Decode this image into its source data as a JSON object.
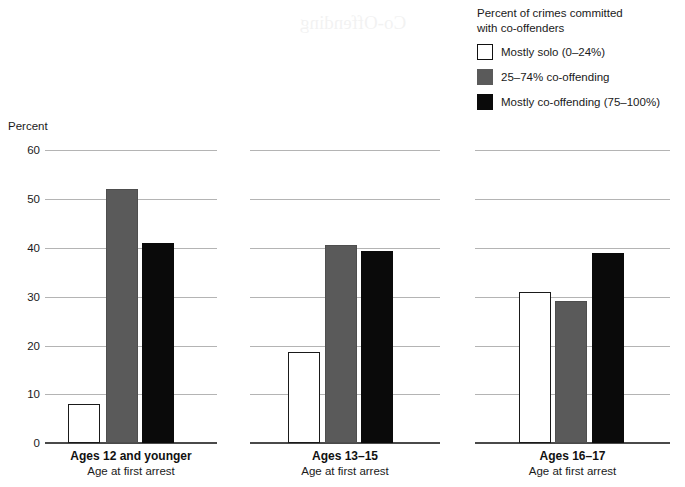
{
  "legend": {
    "title": "Percent of crimes committed\nwith co-offenders",
    "items": [
      {
        "label": "Mostly solo (0–24%)",
        "swatch": "white",
        "color": "#ffffff"
      },
      {
        "label": "25–74% co-offending",
        "swatch": "gray",
        "color": "#5a5a5a"
      },
      {
        "label": "Mostly co-offending (75–100%)",
        "swatch": "black",
        "color": "#0a0a0a"
      }
    ]
  },
  "axis": {
    "label": "Percent",
    "ticks": [
      "60",
      "50",
      "40",
      "30",
      "20",
      "10",
      "0"
    ]
  },
  "panels": [
    {
      "title": "Ages 12 and younger",
      "subtitle": "Age at first arrest"
    },
    {
      "title": "Ages 13–15",
      "subtitle": "Age at first arrest"
    },
    {
      "title": "Ages 16–17",
      "subtitle": "Age at first arrest"
    }
  ],
  "chart_data": {
    "type": "bar",
    "title": "",
    "xlabel": "Age at first arrest",
    "ylabel": "Percent",
    "ylim": [
      0,
      60
    ],
    "yticks": [
      0,
      10,
      20,
      30,
      40,
      50,
      60
    ],
    "grid": true,
    "legend_position": "top-right",
    "legend_title": "Percent of crimes committed with co-offenders",
    "categories": [
      "Ages 12 and younger",
      "Ages 13–15",
      "Ages 16–17"
    ],
    "series": [
      {
        "name": "Mostly solo (0–24%)",
        "color": "#ffffff",
        "values": [
          8,
          18.6,
          31
        ]
      },
      {
        "name": "25–74% co-offending",
        "color": "#5a5a5a",
        "values": [
          52,
          40.5,
          29
        ]
      },
      {
        "name": "Mostly co-offending (75–100%)",
        "color": "#0a0a0a",
        "values": [
          41,
          39.4,
          39
        ]
      }
    ]
  }
}
